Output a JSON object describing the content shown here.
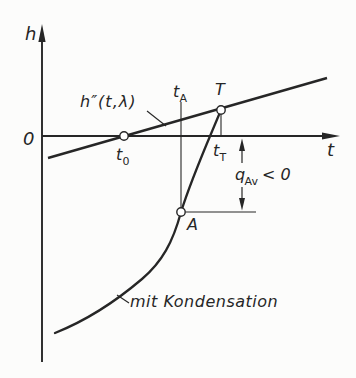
{
  "figure": {
    "axes": {
      "y_label": "h",
      "x_label": "t",
      "origin_label": "0"
    },
    "saturation_line": {
      "label": "h″(t,λ)"
    },
    "points": {
      "t0": {
        "main": "t",
        "sub": "0"
      },
      "tA": {
        "main": "t",
        "sub": "A"
      },
      "T": {
        "label": "T"
      },
      "tT": {
        "main": "t",
        "sub": "T"
      },
      "A": {
        "label": "A"
      }
    },
    "heat_annotation": {
      "symbol": "q",
      "sub": "Av",
      "relation": "< 0"
    },
    "curve_label": "mit Kondensation"
  },
  "colors": {
    "ink": "#262626",
    "background": "#fcfcfb"
  }
}
